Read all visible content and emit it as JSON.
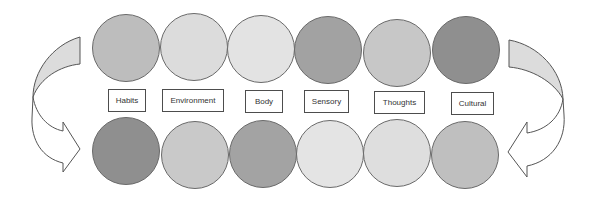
{
  "diagram": {
    "labels": [
      {
        "text": "Habits",
        "x": 108,
        "w": 38
      },
      {
        "text": "Environment",
        "x": 162,
        "w": 62
      },
      {
        "text": "Body",
        "x": 245,
        "w": 38
      },
      {
        "text": "Sensory",
        "x": 304,
        "w": 45
      },
      {
        "text": "Thoughts",
        "x": 374,
        "w": 51
      },
      {
        "text": "Cultural",
        "x": 451,
        "w": 43
      }
    ],
    "top_row_colors": [
      "#bdbdbd",
      "#dcdcdc",
      "#e3e3e3",
      "#a2a2a2",
      "#c7c7c7",
      "#8f8f8f"
    ],
    "bottom_row_colors": [
      "#8f8f8f",
      "#c9c9c9",
      "#a3a3a3",
      "#e4e4e4",
      "#dedede",
      "#bfbfbf"
    ],
    "arrows": [
      {
        "name": "left-curved-arrow",
        "direction": "down-right",
        "fill_color": "#dcdcdc"
      },
      {
        "name": "right-curved-arrow",
        "direction": "down-left",
        "fill_color": "#dcdcdc"
      }
    ]
  }
}
